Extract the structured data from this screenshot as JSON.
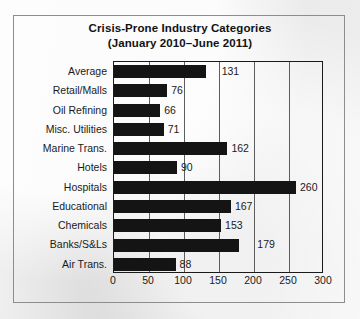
{
  "figure": {
    "title": "Crisis-Prone Industry Categories",
    "subtitle": "(January 2010–June 2011)"
  },
  "chart_data": {
    "type": "bar",
    "orientation": "horizontal",
    "title": "Crisis-Prone Industry Categories",
    "subtitle": "(January 2010–June 2011)",
    "xlabel": "",
    "ylabel": "",
    "xlim": [
      0,
      300
    ],
    "xticks": [
      0,
      50,
      100,
      150,
      200,
      250,
      300
    ],
    "xtick_labels": [
      "0",
      "50",
      "100",
      "150",
      "200",
      "250",
      "300"
    ],
    "grid": true,
    "legend": null,
    "bar_color": "#141414",
    "categories": [
      "Average",
      "Retail/Malls",
      "Oil Refining",
      "Misc. Utilities",
      "Marine Trans.",
      "Hotels",
      "Hospitals",
      "Educational",
      "Chemicals",
      "Banks/S&Ls",
      "Air Trans."
    ],
    "values": [
      131,
      76,
      66,
      71,
      162,
      90,
      260,
      167,
      153,
      179,
      88
    ],
    "value_labels": [
      "131",
      "76",
      "66",
      "71",
      "162",
      "90",
      "260",
      "167",
      "153",
      "179",
      "88"
    ],
    "label_offsets": [
      12,
      0,
      0,
      0,
      0,
      0,
      0,
      0,
      0,
      14,
      0
    ]
  }
}
